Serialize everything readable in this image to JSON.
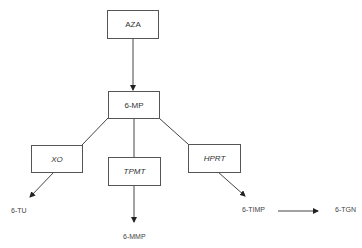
{
  "diagram": {
    "nodes": {
      "aza": {
        "label": "AZA"
      },
      "mp": {
        "label": "6-MP"
      },
      "xo": {
        "label": "XO"
      },
      "tpmt": {
        "label": "TPMT"
      },
      "hprt": {
        "label": "HPRT"
      }
    },
    "products": {
      "tu": "6-TU",
      "mmp": "6-MMP",
      "timp": "6-TIMP",
      "tgn": "6-TGN"
    },
    "edges": [
      {
        "from": "AZA",
        "to": "6-MP"
      },
      {
        "from": "6-MP",
        "to": "XO"
      },
      {
        "from": "6-MP",
        "to": "TPMT"
      },
      {
        "from": "6-MP",
        "to": "HPRT"
      },
      {
        "from": "XO",
        "to": "6-TU"
      },
      {
        "from": "TPMT",
        "to": "6-MMP"
      },
      {
        "from": "HPRT",
        "to": "6-TIMP"
      },
      {
        "from": "6-TIMP",
        "to": "6-TGN"
      }
    ]
  }
}
